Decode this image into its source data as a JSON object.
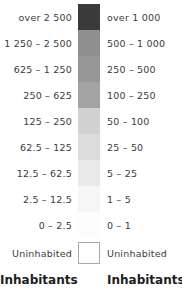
{
  "legend": {
    "title_left": "Inhabitants",
    "title_right": "Inhabitants",
    "uninhabited_left": "Uninhabited",
    "uninhabited_right": "Uninhabited",
    "rows": [
      {
        "left": "over 2 500",
        "right": "over 1 000",
        "color": "#3a3a3a"
      },
      {
        "left": "1 250 – 2 500",
        "right": "500 – 1 000",
        "color": "#8f8f8f"
      },
      {
        "left": "625 – 1 250",
        "right": "250 – 500",
        "color": "#969696"
      },
      {
        "left": "250 – 625",
        "right": "100 – 250",
        "color": "#a3a3a3"
      },
      {
        "left": "125 – 250",
        "right": "50 – 100",
        "color": "#d2d2d2"
      },
      {
        "left": "62.5 – 125",
        "right": "25 – 50",
        "color": "#dcdcdc"
      },
      {
        "left": "12.5 – 62.5",
        "right": "5 – 25",
        "color": "#e9e9e9"
      },
      {
        "left": "2.5 – 12.5",
        "right": "1 – 5",
        "color": "#f6f6f6"
      },
      {
        "left": "0 – 2.5",
        "right": "0 – 1",
        "color": "#fdfdfd"
      }
    ]
  },
  "chart_data": {
    "type": "table",
    "columns": [
      "Inhabitants",
      "swatch",
      "Inhabitants"
    ],
    "categories": [
      "over 2 500",
      "1 250 – 2 500",
      "625 – 1 250",
      "250 – 625",
      "125 – 250",
      "62.5 – 125",
      "12.5 – 62.5",
      "2.5 – 12.5",
      "0 – 2.5",
      "Uninhabited"
    ],
    "series": [
      {
        "name": "Inhabitants (left scale)",
        "values": [
          "over 2 500",
          "1 250 – 2 500",
          "625 – 1 250",
          "250 – 625",
          "125 – 250",
          "62.5 – 125",
          "12.5 – 62.5",
          "2.5 – 12.5",
          "0 – 2.5",
          "Uninhabited"
        ]
      },
      {
        "name": "Inhabitants (right scale)",
        "values": [
          "over 1 000",
          "500 – 1 000",
          "250 – 500",
          "100 – 250",
          "50 – 100",
          "25 – 50",
          "5 – 25",
          "1 – 5",
          "0 – 1",
          "Uninhabited"
        ]
      }
    ],
    "colors": [
      "#3a3a3a",
      "#8f8f8f",
      "#969696",
      "#a3a3a3",
      "#d2d2d2",
      "#dcdcdc",
      "#e9e9e9",
      "#f6f6f6",
      "#fdfdfd",
      "#ffffff"
    ],
    "grid": false,
    "legend_position": "none"
  }
}
